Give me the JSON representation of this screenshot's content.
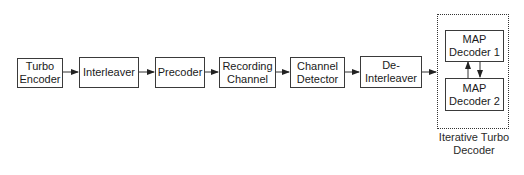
{
  "diagram": {
    "type": "block-diagram",
    "blocks": [
      {
        "id": "turbo-encoder",
        "label": "Turbo\nEncoder"
      },
      {
        "id": "interleaver",
        "label": "Interleaver"
      },
      {
        "id": "precoder",
        "label": "Precoder"
      },
      {
        "id": "recording-channel",
        "label": "Recording\nChannel"
      },
      {
        "id": "channel-detector",
        "label": "Channel\nDetector"
      },
      {
        "id": "de-interleaver",
        "label": "De-\nInterleaver"
      }
    ],
    "decoder_group": {
      "caption": "Iterative Turbo\nDecoder",
      "blocks": [
        {
          "id": "map-decoder-1",
          "label": "MAP\nDecoder 1"
        },
        {
          "id": "map-decoder-2",
          "label": "MAP\nDecoder 2"
        }
      ]
    },
    "edges": [
      [
        "turbo-encoder",
        "interleaver"
      ],
      [
        "interleaver",
        "precoder"
      ],
      [
        "precoder",
        "recording-channel"
      ],
      [
        "recording-channel",
        "channel-detector"
      ],
      [
        "channel-detector",
        "de-interleaver"
      ],
      [
        "de-interleaver",
        "iterative-turbo-decoder"
      ],
      [
        "map-decoder-2",
        "map-decoder-1"
      ],
      [
        "map-decoder-1",
        "map-decoder-2"
      ]
    ],
    "colors": {
      "line": "#3a3a3a",
      "background": "#ffffff",
      "text": "#1a1a1a"
    }
  }
}
